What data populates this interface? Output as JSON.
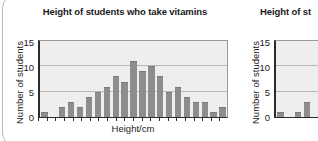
{
  "page": {
    "background_color": "#ffffff",
    "card_border_color": "#b9b9b9"
  },
  "style": {
    "bar_color": "#8d8d8d",
    "plot_background": "#eeeeee",
    "axis_color": "#2b2b2b",
    "grid_color": "#b6b6b6",
    "text_color": "#1a1a1a"
  },
  "charts": [
    {
      "title": "Height of students who take vitamins",
      "ylabel": "Number of students",
      "xlabel": "Height/cm",
      "yticks": [
        "15",
        "10",
        "5",
        "0"
      ]
    },
    {
      "title": "Height of st",
      "ylabel": "Number of students",
      "xlabel": "",
      "yticks": [
        "15",
        "10",
        "5",
        "0"
      ]
    }
  ],
  "chart_data": [
    {
      "type": "bar",
      "title": "Height of students who take vitamins",
      "xlabel": "Height/cm",
      "ylabel": "Number of students",
      "ylim": [
        0,
        15
      ],
      "yticks": [
        0,
        5,
        10,
        15
      ],
      "grid": true,
      "legend": "none",
      "categories": [
        "1",
        "2",
        "3",
        "4",
        "5",
        "6",
        "7",
        "8",
        "9",
        "10",
        "11",
        "12",
        "13",
        "14",
        "15",
        "16",
        "17",
        "18",
        "19",
        "20",
        "21"
      ],
      "values": [
        1,
        0,
        2,
        3,
        2,
        4,
        5,
        6,
        8,
        7,
        11,
        9,
        10,
        8,
        5,
        6,
        4,
        3,
        3,
        1,
        2
      ]
    },
    {
      "type": "bar",
      "title": "Height of st",
      "xlabel": "",
      "ylabel": "Number of students",
      "ylim": [
        0,
        15
      ],
      "yticks": [
        0,
        5,
        10,
        15
      ],
      "grid": true,
      "legend": "none",
      "note": "chart clipped at right edge of screenshot",
      "categories": [
        "1",
        "2",
        "3",
        "4"
      ],
      "values": [
        1,
        0,
        1,
        3
      ]
    }
  ]
}
